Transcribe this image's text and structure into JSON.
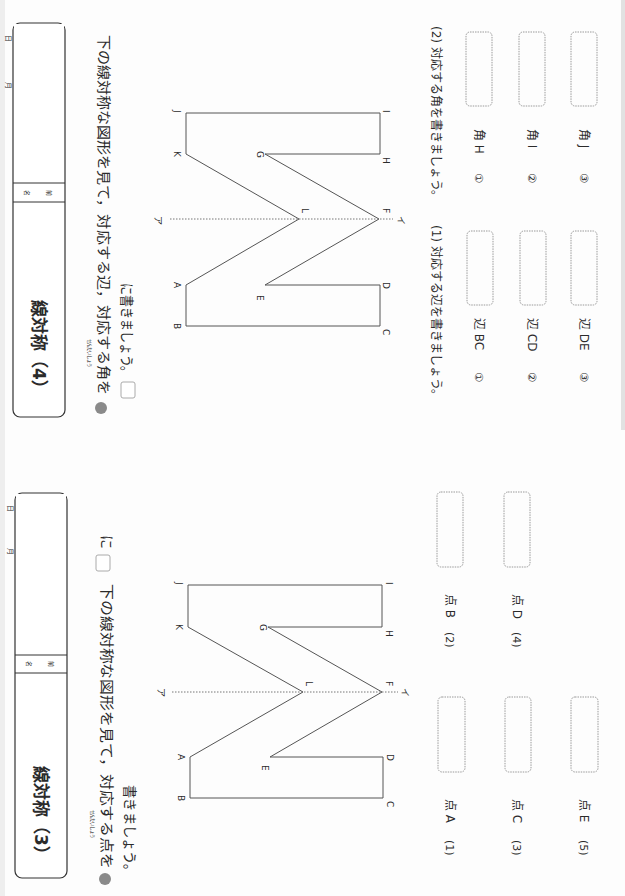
{
  "worksheets": [
    {
      "id": "top",
      "title": "線対称（4）",
      "name_label": [
        "名",
        "前"
      ],
      "date_labels": {
        "month": "月",
        "day": "日"
      },
      "furigana": "せんたいしょう",
      "instruction_line1": "下の線対称な図形を見て，対応する辺，対応する角を",
      "instruction_line2": "に書きましょう。",
      "figure": {
        "axis_top_label": "ア",
        "axis_bottom_label": "イ",
        "points": {
          "A": "A",
          "B": "B",
          "C": "C",
          "D": "D",
          "E": "E",
          "F": "F",
          "G": "G",
          "H": "H",
          "I": "I",
          "J": "J",
          "K": "K",
          "L": "L"
        }
      },
      "part1": {
        "heading": "(1) 対応する辺を書きましょう。",
        "items": [
          {
            "num": "①",
            "label": "辺 BC",
            "answer": ""
          },
          {
            "num": "②",
            "label": "辺 CD",
            "answer": ""
          },
          {
            "num": "③",
            "label": "辺 DE",
            "answer": ""
          }
        ]
      },
      "part2": {
        "heading": "(2) 対応する角を書きましょう。",
        "items": [
          {
            "num": "①",
            "label": "角 H",
            "answer": ""
          },
          {
            "num": "②",
            "label": "角 I",
            "answer": ""
          },
          {
            "num": "③",
            "label": "角 J",
            "answer": ""
          }
        ]
      }
    },
    {
      "id": "bottom",
      "title": "線対称（3）",
      "name_label": [
        "名",
        "前"
      ],
      "date_labels": {
        "month": "月",
        "day": "日"
      },
      "furigana": "せんたいしょう",
      "instruction_line1": "下の線対称な図形を見て，対応する点を",
      "instruction_line1_tail": "に",
      "instruction_line2": "書きましょう。",
      "figure": {
        "axis_top_label": "ア",
        "axis_bottom_label": "イ",
        "points": {
          "A": "A",
          "B": "B",
          "C": "C",
          "D": "D",
          "E": "E",
          "F": "F",
          "G": "G",
          "H": "H",
          "I": "I",
          "J": "J",
          "K": "K",
          "L": "L"
        }
      },
      "items": [
        {
          "num": "(1)",
          "label": "点 A",
          "answer": ""
        },
        {
          "num": "(2)",
          "label": "点 B",
          "answer": ""
        },
        {
          "num": "(3)",
          "label": "点 C",
          "answer": ""
        },
        {
          "num": "(4)",
          "label": "点 D",
          "answer": ""
        },
        {
          "num": "(5)",
          "label": "点 E",
          "answer": ""
        }
      ]
    }
  ],
  "colors": {
    "bullet": "#8a8a8a",
    "line": "#555555",
    "box_border": "#9a9a9a"
  }
}
